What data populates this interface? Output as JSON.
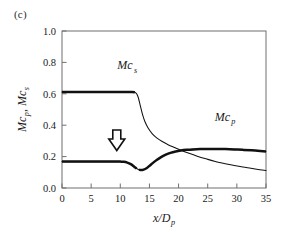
{
  "figure": {
    "panel_label": "(c)",
    "background": "#ffffff",
    "ink_color": "#1a1a1a"
  },
  "chart_data": {
    "type": "line",
    "title": "",
    "subtitle": "",
    "panel": "(c)",
    "xlabel": "x/Dp",
    "xlabel_parts": {
      "base1": "x/D",
      "sub1": "p"
    },
    "ylabel": "Mcp, Mcs",
    "ylabel_parts": {
      "base1": "Mc",
      "sub1": "p",
      "mid": ", ",
      "base2": "Mc",
      "sub2": "s"
    },
    "xlim": [
      0,
      35
    ],
    "ylim": [
      0.0,
      1.0
    ],
    "xticks": [
      0,
      5,
      10,
      15,
      20,
      25,
      30,
      35
    ],
    "xtick_labels": [
      "0",
      "5",
      "10",
      "15",
      "20",
      "25",
      "30",
      "35"
    ],
    "yticks": [
      0.0,
      0.2,
      0.4,
      0.6,
      0.8,
      1.0
    ],
    "ytick_labels": [
      "0.0",
      "0.2",
      "0.4",
      "0.6",
      "0.8",
      "1.0"
    ],
    "grid": false,
    "legend_position": "inline-annotations",
    "tick_direction": "in",
    "series": [
      {
        "name": "Mcs",
        "label": "Mc s",
        "label_base": "Mc",
        "label_sub": "s",
        "label_x": 9.5,
        "label_y": 0.755,
        "linewidth_px": 2.6,
        "color": "#111111",
        "x": [
          0,
          1,
          2,
          3,
          4,
          5,
          6,
          7,
          8,
          9,
          10,
          11,
          12,
          12.5,
          12.8,
          13.1,
          13.4,
          13.8,
          14.2,
          14.8,
          15.5,
          16.3,
          17.2,
          18.2,
          19.3,
          20.5,
          21.8,
          23.2,
          24.7,
          26.3,
          28.0,
          29.8,
          31.6,
          33.4,
          35
        ],
        "y": [
          0.612,
          0.612,
          0.612,
          0.612,
          0.612,
          0.612,
          0.612,
          0.612,
          0.612,
          0.612,
          0.612,
          0.612,
          0.612,
          0.61,
          0.6,
          0.575,
          0.53,
          0.47,
          0.425,
          0.38,
          0.345,
          0.318,
          0.296,
          0.276,
          0.258,
          0.239,
          0.221,
          0.203,
          0.186,
          0.169,
          0.155,
          0.142,
          0.131,
          0.12,
          0.112
        ],
        "bold_from_x": 0,
        "bold_to_x": 12.6,
        "description": "Starts flat at 0.612, drops sharply near x/Dp=13, then decays to 0.112 at x/Dp=35"
      },
      {
        "name": "Mcp",
        "label": "Mc p",
        "label_base": "Mc",
        "label_sub": "p",
        "label_x": 26.2,
        "label_y": 0.425,
        "linewidth_px": 2.6,
        "color": "#111111",
        "x": [
          0,
          1,
          2,
          3,
          4,
          5,
          6,
          7,
          8,
          9,
          10,
          10.6,
          11.2,
          11.8,
          12.3,
          12.8,
          13.2,
          13.6,
          14.0,
          14.5,
          15.0,
          15.6,
          16.3,
          17.0,
          17.8,
          18.6,
          19.5,
          20.4,
          21.4,
          22.5,
          23.7,
          25.0,
          26.5,
          28.0,
          29.5,
          31.0,
          32.5,
          34.0,
          35
        ],
        "y": [
          0.168,
          0.168,
          0.168,
          0.168,
          0.168,
          0.168,
          0.168,
          0.168,
          0.168,
          0.168,
          0.168,
          0.167,
          0.162,
          0.152,
          0.138,
          0.124,
          0.116,
          0.114,
          0.117,
          0.126,
          0.141,
          0.16,
          0.18,
          0.197,
          0.212,
          0.224,
          0.233,
          0.239,
          0.243,
          0.246,
          0.248,
          0.249,
          0.249,
          0.248,
          0.246,
          0.243,
          0.24,
          0.236,
          0.233
        ],
        "description": "Flat at 0.168, dips to ~0.114 near x/Dp=13.6, rises to plateau ~0.249 then gently falls to 0.233"
      }
    ],
    "annotations": [
      {
        "name": "down-arrow",
        "symbol": "hollow-down-arrow",
        "x": 9.4,
        "y": 0.285,
        "description": "Hollow downward arrow pointing at the Mcp curve"
      }
    ],
    "crossover": {
      "x": 19.0,
      "y": 0.235
    }
  }
}
